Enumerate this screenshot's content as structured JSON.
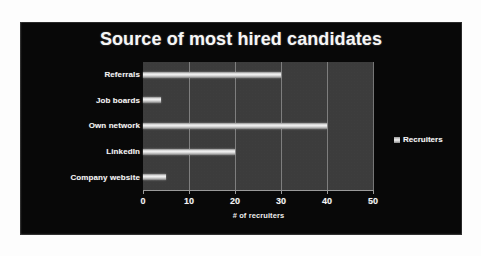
{
  "chart_data": {
    "type": "bar",
    "orientation": "horizontal",
    "title": "Source of most hired candidates",
    "xlabel": "# of recruiters",
    "ylabel": "Source of hires",
    "categories": [
      "Referrals",
      "Job boards",
      "Own network",
      "LinkedIn",
      "Company website"
    ],
    "values": [
      30,
      4,
      40,
      20,
      5
    ],
    "series": [
      {
        "name": "Recruiters",
        "values": [
          30,
          4,
          40,
          20,
          5
        ]
      }
    ],
    "xlim": [
      0,
      50
    ],
    "xticks": [
      "0",
      "10",
      "20",
      "30",
      "40",
      "50"
    ],
    "xtick_values": [
      0,
      10,
      20,
      30,
      40,
      50
    ],
    "grid": "vertical",
    "legend": {
      "position": "right",
      "entries": [
        {
          "label": "Recruiters",
          "marker": "legend-swatch-icon"
        }
      ]
    },
    "colors": {
      "chart_background": "#080808",
      "plot_background": "#3c3c3c",
      "gridline": "#8a8a8a",
      "bar_fill": "#e8e8e8",
      "text": "#f4f4f4"
    }
  },
  "legend": {
    "recruiters_label": "Recruiters"
  }
}
